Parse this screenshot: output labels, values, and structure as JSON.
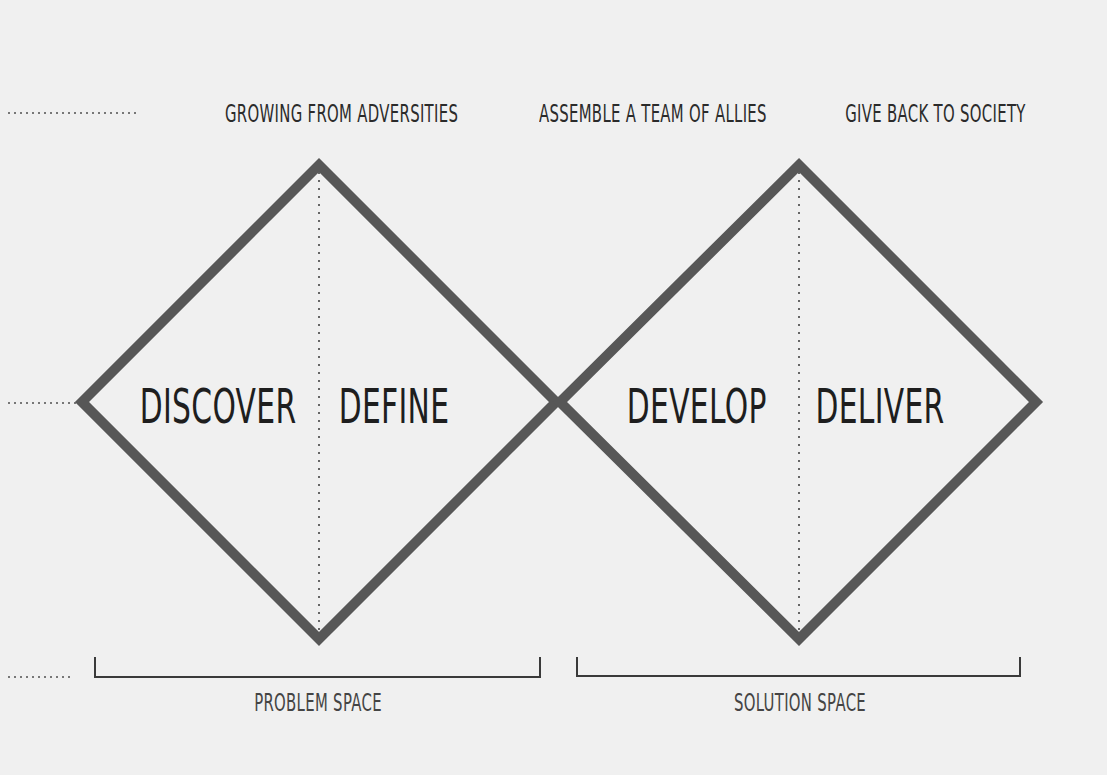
{
  "diagram": {
    "title_rows": {
      "top_labels": [
        {
          "text": "GROWING FROM ADVERSITIES",
          "center_x": 318
        },
        {
          "text": "ASSEMBLE A TEAM OF ALLIES",
          "center_x": 632
        },
        {
          "text": "GIVE BACK TO SOCIETY",
          "center_x": 932
        }
      ]
    },
    "phases": [
      {
        "text": "DISCOVER",
        "center_x": 208
      },
      {
        "text": "DEFINE",
        "center_x": 394
      },
      {
        "text": "DEVELOP",
        "center_x": 695
      },
      {
        "text": "DELIVER",
        "center_x": 880
      }
    ],
    "spaces": [
      {
        "text": "PROBLEM SPACE",
        "center_x": 318,
        "bracket": [
          95,
          540
        ]
      },
      {
        "text": "SOLUTION SPACE",
        "center_x": 800,
        "bracket": [
          577,
          1020
        ]
      }
    ],
    "shape": {
      "type": "double-diamond",
      "left_diamond": {
        "left": [
          78,
          402
        ],
        "top": [
          319,
          162
        ],
        "right": [
          558,
          402
        ],
        "bottom": [
          319,
          640
        ]
      },
      "right_diamond": {
        "left": [
          558,
          402
        ],
        "top": [
          799,
          162
        ],
        "right": [
          1038,
          402
        ],
        "bottom": [
          799,
          640
        ]
      },
      "stroke_color": "#575757",
      "stroke_width": 10,
      "dotted_color": "#666666"
    },
    "colors": {
      "background": "#f0f0f0",
      "text": "#2b2b2b",
      "bracket": "#3a3a3a"
    }
  }
}
